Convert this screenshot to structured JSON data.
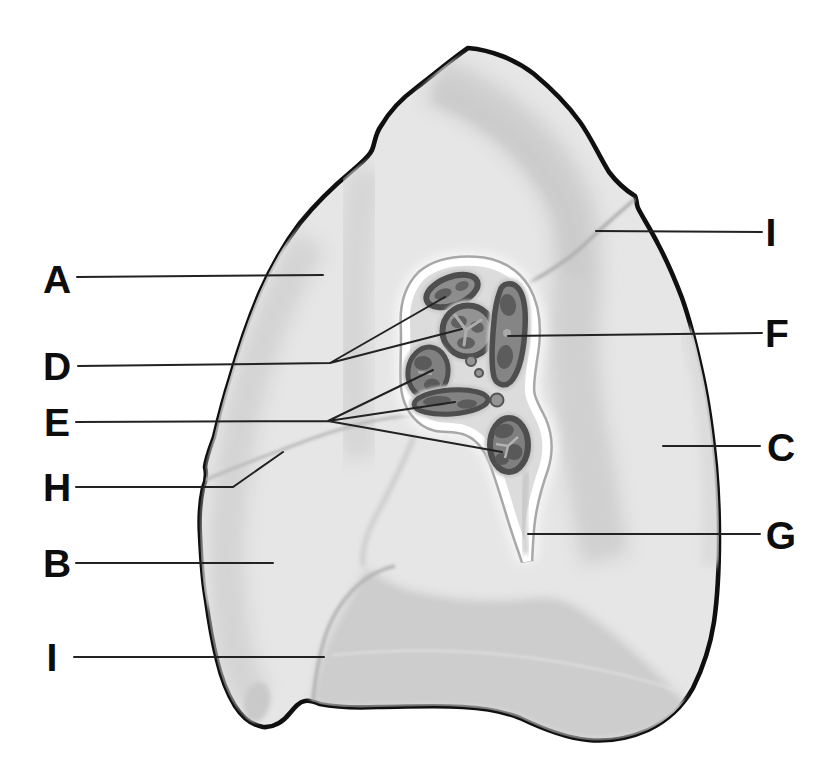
{
  "figure": {
    "kind": "labeled-anatomy-diagram",
    "background": "#ffffff",
    "outline_color": "#101010",
    "lung_fill": "#f3f3f3",
    "shading_color": "#dedede",
    "base_shading_color": "#d6d6d6",
    "hilum_fill": "#dcdcdc",
    "hilum_border": "#ffffff",
    "vessel_ring_color": "#4e4e4e",
    "vessel_fill_color": "#8a8a8a",
    "leader_color": "#222222",
    "label_color": "#0d0d0d"
  },
  "labels": [
    {
      "letter": "A",
      "side": "left"
    },
    {
      "letter": "D",
      "side": "left"
    },
    {
      "letter": "E",
      "side": "left"
    },
    {
      "letter": "H",
      "side": "left"
    },
    {
      "letter": "B",
      "side": "left"
    },
    {
      "letter": "I",
      "side": "left"
    },
    {
      "letter": "I",
      "side": "right"
    },
    {
      "letter": "F",
      "side": "right"
    },
    {
      "letter": "C",
      "side": "right"
    },
    {
      "letter": "G",
      "side": "right"
    }
  ]
}
